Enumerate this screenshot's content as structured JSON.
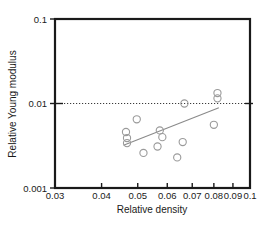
{
  "chart_data": {
    "type": "scatter",
    "title": "",
    "xlabel": "Relative density",
    "ylabel": "Relative Young modulus",
    "xscale": "log",
    "yscale": "log",
    "xlim": [
      0.03,
      0.1
    ],
    "ylim": [
      0.001,
      0.1
    ],
    "grid": false,
    "legend": null,
    "x_tick_labels": [
      "0.03",
      "0.04",
      "0.05",
      "0.06",
      "0.07",
      "0.08",
      "0.09",
      "0.1"
    ],
    "x_tick_values": [
      0.03,
      0.04,
      0.05,
      0.06,
      0.07,
      0.08,
      0.09,
      0.1
    ],
    "y_tick_labels": [
      "0.001",
      "0.01",
      "0.1"
    ],
    "y_tick_values": [
      0.001,
      0.01,
      0.1
    ],
    "series": [
      {
        "name": "data",
        "marker": "open-circle",
        "color": "#9a9a9a",
        "points": [
          {
            "x": 0.0465,
            "y": 0.0046
          },
          {
            "x": 0.0468,
            "y": 0.0039
          },
          {
            "x": 0.0468,
            "y": 0.0034
          },
          {
            "x": 0.0497,
            "y": 0.0065
          },
          {
            "x": 0.0518,
            "y": 0.0026
          },
          {
            "x": 0.0565,
            "y": 0.0031
          },
          {
            "x": 0.0573,
            "y": 0.0048
          },
          {
            "x": 0.0582,
            "y": 0.004
          },
          {
            "x": 0.0638,
            "y": 0.0023
          },
          {
            "x": 0.066,
            "y": 0.0035
          },
          {
            "x": 0.0667,
            "y": 0.01
          },
          {
            "x": 0.08,
            "y": 0.0056
          },
          {
            "x": 0.0818,
            "y": 0.0133
          },
          {
            "x": 0.0818,
            "y": 0.0115
          }
        ]
      }
    ],
    "annotations": [
      {
        "name": "trend-line",
        "type": "line",
        "color": "#8a8a8a",
        "x0": 0.0458,
        "y0": 0.0032,
        "x1": 0.0825,
        "y1": 0.0089
      },
      {
        "name": "reference-line",
        "type": "hline",
        "style": "dotted",
        "color": "#3b3b3b",
        "y": 0.01
      }
    ]
  }
}
